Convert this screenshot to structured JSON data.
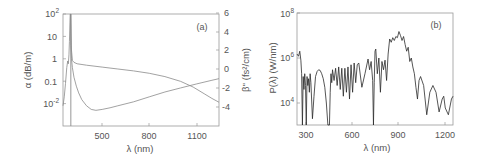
{
  "chart_data": [
    {
      "panel": "(a)",
      "type": "line",
      "title": "",
      "xlabel": "λ (nm)",
      "ylabel": "α (dB/m)",
      "ylabel_right": "β'' (fs²/cm)",
      "xlim": [
        250,
        1245
      ],
      "ylim": [
        0.001,
        100
      ],
      "yscale": "log",
      "ylim_right": [
        -6,
        6
      ],
      "grid": false,
      "x_ticks": [
        500,
        800,
        1100
      ],
      "x_tick_labels": [
        "500",
        "800",
        "1100"
      ],
      "y_ticks": [
        100,
        10,
        1,
        0.1,
        0.01
      ],
      "y_tick_labels": [
        "10²",
        "10",
        "1",
        "0.1",
        "10⁻²"
      ],
      "y_right_ticks": [
        6,
        4,
        2,
        0,
        -2,
        -4
      ],
      "y_right_tick_labels": [
        "6",
        "4",
        "2",
        "0",
        "-2",
        "-4"
      ],
      "series": [
        {
          "name": "α (loss)",
          "axis": "left",
          "x": [
            250,
            258,
            266,
            274,
            280,
            284,
            288,
            291,
            294,
            296,
            298,
            300,
            304,
            310,
            320,
            335,
            350,
            370,
            400,
            430,
            460,
            500,
            550,
            600,
            700,
            800,
            900,
            1000,
            1100,
            1200,
            1245
          ],
          "y": [
            0.008,
            0.02,
            0.08,
            0.4,
            0.8,
            0.6,
            1.5,
            6,
            40,
            100,
            100,
            4,
            1.0,
            0.4,
            0.15,
            0.06,
            0.03,
            0.015,
            0.008,
            0.0055,
            0.005,
            0.0055,
            0.0065,
            0.008,
            0.012,
            0.02,
            0.033,
            0.05,
            0.075,
            0.11,
            0.13
          ]
        },
        {
          "name": "β'' (GVD)",
          "axis": "right",
          "x": [
            300,
            304,
            310,
            320,
            340,
            400,
            500,
            600,
            700,
            800,
            900,
            1000,
            1080,
            1150,
            1200,
            1245
          ],
          "y": [
            6,
            2.0,
            0.9,
            0.7,
            0.55,
            0.4,
            0.2,
            0.0,
            -0.2,
            -0.45,
            -0.8,
            -1.3,
            -1.9,
            -2.6,
            -3.1,
            -3.5
          ]
        }
      ],
      "resonance_line_x": 300,
      "annotation": "(a)"
    },
    {
      "panel": "(b)",
      "type": "line",
      "title": "",
      "xlabel": "λ (nm)",
      "ylabel": "P(λ) (W/nm)",
      "xlim": [
        240,
        1250
      ],
      "ylim": [
        1000,
        100000000
      ],
      "yscale": "log",
      "grid": false,
      "x_ticks": [
        300,
        600,
        900,
        1200
      ],
      "x_tick_labels": [
        "300",
        "600",
        "900",
        "1200"
      ],
      "y_ticks": [
        100000000,
        1000000,
        10000
      ],
      "y_tick_labels": [
        "10⁸",
        "10⁶",
        "10⁴"
      ],
      "series": [
        {
          "name": "P(λ)",
          "x": [
            240,
            250,
            258,
            265,
            270,
            275,
            280,
            285,
            290,
            295,
            300,
            305,
            310,
            315,
            320,
            325,
            330,
            340,
            350,
            360,
            370,
            380,
            390,
            400,
            410,
            420,
            430,
            440,
            450,
            455,
            460,
            465,
            470,
            480,
            490,
            500,
            510,
            520,
            530,
            540,
            550,
            560,
            570,
            580,
            590,
            600,
            610,
            620,
            630,
            640,
            660,
            680,
            700,
            710,
            720,
            730,
            735,
            740,
            745,
            750,
            760,
            770,
            780,
            790,
            800,
            810,
            820,
            830,
            840,
            850,
            860,
            870,
            880,
            890,
            900,
            910,
            920,
            930,
            940,
            950,
            960,
            970,
            980,
            990,
            1000,
            1010,
            1020,
            1030,
            1040,
            1060,
            1080,
            1100,
            1120,
            1140,
            1160,
            1180,
            1190,
            1200,
            1220,
            1240,
            1250
          ],
          "y": [
            1500000,
            1200000,
            2000000,
            800000,
            200000,
            1000,
            150000,
            40000,
            200000,
            60000,
            1000,
            150000,
            60000,
            120000,
            30000,
            200000,
            80000,
            2000,
            20000,
            150000,
            250000,
            300000,
            280000,
            200000,
            120000,
            50000,
            10000,
            1000,
            1000,
            30000,
            200000,
            80000,
            300000,
            100000,
            350000,
            60000,
            400000,
            40000,
            350000,
            20000,
            350000,
            30000,
            400000,
            15000,
            500000,
            30000,
            600000,
            80000,
            500000,
            600000,
            50000,
            200000,
            900000,
            300000,
            700000,
            100000,
            1000,
            80000,
            2000000,
            2500000,
            200000,
            1000000,
            30000,
            700000,
            300000,
            800000,
            100000,
            1500000,
            7000000,
            5000000,
            8000000,
            6000000,
            9000000,
            8000000,
            15000000,
            10000000,
            6000000,
            9000000,
            4000000,
            2000000,
            3000000,
            700000,
            1000000,
            400000,
            200000,
            50000,
            15000,
            100000,
            150000,
            60000,
            3000,
            30000,
            60000,
            30000,
            4000,
            15000,
            20000,
            6000,
            3000,
            15000,
            20000
          ],
          "color": "#222222"
        }
      ],
      "annotation": "(b)"
    }
  ],
  "panel_a": {
    "tag": "(a)",
    "xlabel": "λ (nm)",
    "ylabel_left": "α (dB/m)",
    "ylabel_right": "β'' (fs²/cm)",
    "x_ticks": [
      "500",
      "800",
      "1100"
    ],
    "y_left_ticks": [
      "10",
      "1",
      "0.1"
    ],
    "y_left_pow_top": {
      "base": "10",
      "exp": "2"
    },
    "y_left_pow_bottom": {
      "base": "10",
      "exp": "-2"
    },
    "y_right_ticks": [
      "6",
      "4",
      "2",
      "0",
      "-2",
      "-4"
    ]
  },
  "panel_b": {
    "tag": "(b)",
    "xlabel": "λ (nm)",
    "ylabel": "P(λ) (W/nm)",
    "x_ticks": [
      "300",
      "600",
      "900",
      "1200"
    ],
    "y_pows": [
      {
        "base": "10",
        "exp": "8"
      },
      {
        "base": "10",
        "exp": "6"
      },
      {
        "base": "10",
        "exp": "4"
      }
    ]
  },
  "colors": {
    "axis": "#9a9a9a",
    "text": "#555555",
    "alpha_curve": "#8a8a8a",
    "beta_curve": "#8a8a8a",
    "spectrum": "#2a2a2a"
  }
}
